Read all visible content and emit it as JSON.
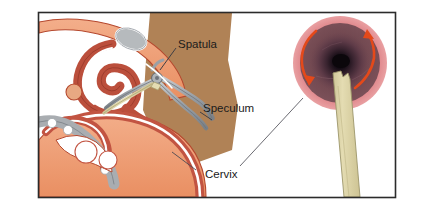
{
  "figure": {
    "frame": {
      "x": 38,
      "y": 12,
      "width": 358,
      "height": 186,
      "border_color": "#2b2b2b"
    },
    "background_color": "#ffffff"
  },
  "panels": [
    {
      "id": "panel-a",
      "letter": "A",
      "caption": "Sagittal view: speculum and spatula in place"
    },
    {
      "id": "panel-b",
      "letter": "B",
      "caption": "En face view of cervix with spatula rotating"
    }
  ],
  "callouts": [
    {
      "id": "spatula",
      "label": "Spatula",
      "x": 178,
      "y": 44
    },
    {
      "id": "speculum",
      "label": "Speculum",
      "x": 203,
      "y": 108
    },
    {
      "id": "cervix",
      "label": "Cervix",
      "x": 205,
      "y": 174
    }
  ],
  "anatomy": {
    "skin_label": "abdominal wall",
    "bowel_label": "bowel",
    "uterus_label": "uterus",
    "bladder_label": "bladder",
    "rectum_label": "rectum",
    "sacrum_label": "sacrum",
    "vagina_label": "vagina"
  },
  "instruments": {
    "speculum_label": "bivalve speculum",
    "spatula_label": "Ayre spatula"
  },
  "cervix_view": {
    "outer_ring_label": "vaginal fornix",
    "disc_label": "ectocervix",
    "os_label": "external os",
    "rotation_label": "360 degree rotation",
    "arrow_count": 2
  },
  "colors": {
    "frame": "#2b2b2b",
    "skin_tan": "#b08256",
    "bowel_salmon": "#ef9c72",
    "bowel_outline": "#b5482e",
    "organ_red": "#c25442",
    "organ_dark": "#a63f30",
    "metal_gray": "#8d9299",
    "metal_light": "#c6cace",
    "bone_gray": "#a9adb1",
    "spatula_cream": "#ded6a8",
    "cervix_pink": "#e0868a",
    "cervix_mauve": "#6e4651",
    "cervix_os": "#120b10",
    "arrow_orange": "#e4491a",
    "text": "#1b1b1b",
    "leader": "#4a4a52",
    "white": "#ffffff"
  }
}
